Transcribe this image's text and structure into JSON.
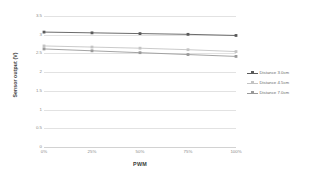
{
  "chart_data": {
    "type": "line",
    "title": "",
    "xlabel": "PWM",
    "ylabel": "Sensor output (V)",
    "categories": [
      "0%",
      "25%",
      "50%",
      "75%",
      "100%"
    ],
    "x_tick_labels": [
      "0%",
      "25%",
      "50%",
      "75%",
      "100%"
    ],
    "y_tick_labels": [
      "3.5",
      "3",
      "2.5",
      "2",
      "1.5",
      "1",
      "0.5",
      "0"
    ],
    "y_ticks": [
      3.5,
      3,
      2.5,
      2,
      1.5,
      1,
      0.5,
      0
    ],
    "ylim": [
      0,
      3.5
    ],
    "grid": true,
    "legend_position": "right",
    "series": [
      {
        "name": "Distance 3.0cm",
        "color": "#5a5a5a",
        "values": [
          3.07,
          3.05,
          3.03,
          3.01,
          2.98
        ]
      },
      {
        "name": "Distance 4.5cm",
        "color": "#c4c4c4",
        "values": [
          2.7,
          2.67,
          2.64,
          2.6,
          2.55
        ]
      },
      {
        "name": "Distance 7.0cm",
        "color": "#9a9a9a",
        "values": [
          2.62,
          2.57,
          2.52,
          2.47,
          2.42
        ]
      }
    ]
  },
  "legend": {
    "entries": [
      {
        "label": "Distance 3.0cm"
      },
      {
        "label": "Distance 4.5cm"
      },
      {
        "label": "Distance 7.0cm"
      }
    ]
  },
  "axes": {
    "y_title": "Sensor output (V)",
    "x_title": "PWM"
  }
}
